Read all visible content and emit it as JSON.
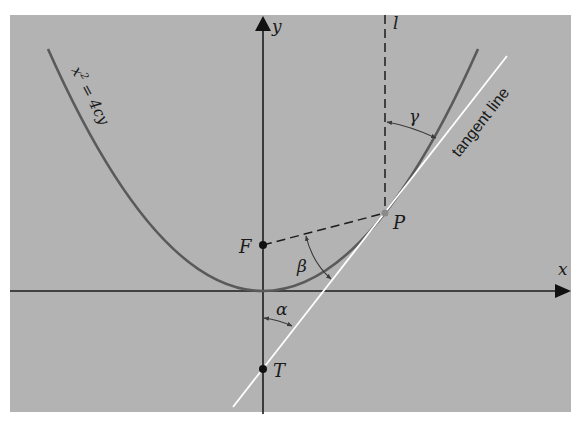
{
  "figure": {
    "type": "parabola-reflective-property",
    "colors": {
      "panel": "#b3b3b3",
      "background": "#ffffff",
      "axis": "#1c1c1c",
      "parabola": "#5a5a5a",
      "tangent": "#ffffff",
      "dashed": "#1c1c1c",
      "text": "#1a1a1a"
    }
  },
  "axes": {
    "x_label": "x",
    "y_label": "y"
  },
  "curve": {
    "equation_label": "x² = 4cy",
    "equation_base": "x",
    "equation_exp": "2",
    "equation_rest": " = 4cy"
  },
  "points": {
    "focus": "F",
    "point_on_curve": "P",
    "tangent_intercept": "T"
  },
  "lines": {
    "vertical_line": "l",
    "tangent_label": "tangent line"
  },
  "angles": {
    "alpha": "α",
    "beta": "β",
    "gamma": "γ"
  }
}
